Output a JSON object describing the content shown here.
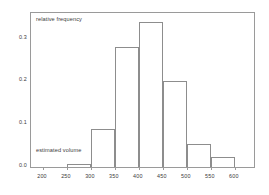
{
  "chart_data": {
    "type": "bar",
    "title": "",
    "subtitle": "",
    "xlabel": "estimated volume",
    "ylabel": "relative frequency",
    "grid": false,
    "legend": null,
    "xlim": [
      175,
      640
    ],
    "ylim": [
      0.0,
      0.36
    ],
    "xticks": [
      200,
      250,
      300,
      350,
      400,
      450,
      500,
      550,
      600
    ],
    "xtick_labels": [
      "200",
      "250",
      "300",
      "350",
      "400",
      "450",
      "500",
      "550",
      "600"
    ],
    "yticks": [
      0.0,
      0.1,
      0.2,
      0.3
    ],
    "ytick_labels": [
      "0.0",
      "0.1",
      "0.2",
      "0.3"
    ],
    "bin_edges": [
      250,
      300,
      350,
      400,
      450,
      500,
      550,
      600
    ],
    "categories": [
      "250-300",
      "300-350",
      "350-400",
      "400-450",
      "450-500",
      "500-550",
      "550-600"
    ],
    "values": [
      0.006,
      0.09,
      0.28,
      0.34,
      0.2,
      0.053,
      0.024
    ],
    "bar_style": {
      "fill": "#ffffff",
      "edge": "#8d8d8d"
    }
  },
  "annotations": {
    "y_axis_note": "relative frequency",
    "x_axis_note": "estimated volume"
  }
}
